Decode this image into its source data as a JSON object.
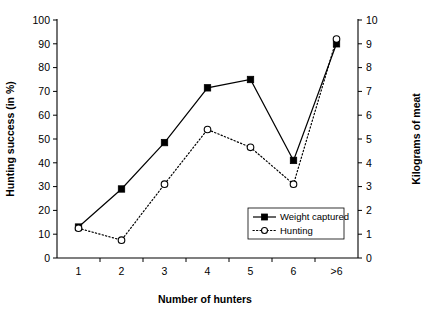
{
  "chart_data": {
    "type": "line",
    "title": "",
    "xlabel": "Number of hunters",
    "ylabel": "Hunting success (in %)",
    "y2label": "Kilograms of meat",
    "categories": [
      "1",
      "2",
      "3",
      "4",
      "5",
      "6",
      ">6"
    ],
    "ylim": [
      0,
      100
    ],
    "yticks": [
      0,
      10,
      20,
      30,
      40,
      50,
      60,
      70,
      80,
      90,
      100
    ],
    "y2lim": [
      0,
      10
    ],
    "y2ticks": [
      0,
      1,
      2,
      3,
      4,
      5,
      6,
      7,
      8,
      9,
      10
    ],
    "grid": false,
    "legend_position": "inside-bottom-right",
    "series": [
      {
        "name": "Weight captured",
        "axis": "right",
        "marker": "filled-square",
        "line": "solid",
        "values": [
          13,
          29,
          48.5,
          71.5,
          75,
          41,
          90
        ],
        "values_kg": [
          1.3,
          2.9,
          4.85,
          7.15,
          7.5,
          4.1,
          9.0
        ]
      },
      {
        "name": "Hunting",
        "axis": "left",
        "marker": "open-circle",
        "line": "dotted",
        "values": [
          12.5,
          7.5,
          31,
          54,
          46.5,
          31,
          92
        ]
      }
    ]
  },
  "legend": {
    "items": [
      {
        "label": "Weight captured",
        "marker": "filled-square",
        "line": "solid"
      },
      {
        "label": "Hunting",
        "marker": "open-circle",
        "line": "dotted"
      }
    ]
  }
}
